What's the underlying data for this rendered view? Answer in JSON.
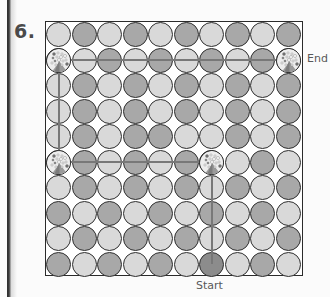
{
  "page": {
    "problem_number": "6.",
    "background_color": "#fbfbfb",
    "page_edge_color": "#2e2e2e"
  },
  "labels": {
    "start": "Start",
    "end": "End"
  },
  "colors": {
    "light_circle": "#d9d9d9",
    "dark_circle": "#a8a8a8",
    "start_circle": "#8c8c8c",
    "circle_outline": "#2f2f2f",
    "path_line": "#787878",
    "frame": "#2b2b2b",
    "text": "#585858"
  },
  "chart_data": {
    "type": "table",
    "rows": 10,
    "columns": 10,
    "cell_size": 25.5,
    "legend": [
      "light",
      "dark"
    ],
    "grid": [
      [
        "light",
        "dark",
        "light",
        "dark",
        "light",
        "dark",
        "light",
        "dark",
        "light",
        "dark"
      ],
      [
        "dark",
        "light",
        "dark",
        "light",
        "dark",
        "light",
        "dark",
        "light",
        "dark",
        "light"
      ],
      [
        "light",
        "dark",
        "light",
        "dark",
        "light",
        "dark",
        "light",
        "dark",
        "light",
        "dark"
      ],
      [
        "light",
        "dark",
        "light",
        "dark",
        "light",
        "dark",
        "light",
        "dark",
        "light",
        "dark"
      ],
      [
        "light",
        "dark",
        "light",
        "dark",
        "dark",
        "light",
        "light",
        "dark",
        "light",
        "dark"
      ],
      [
        "light",
        "dark",
        "light",
        "dark",
        "light",
        "dark",
        "dark",
        "light",
        "dark",
        "light"
      ],
      [
        "light",
        "dark",
        "light",
        "dark",
        "light",
        "dark",
        "light",
        "dark",
        "light",
        "dark"
      ],
      [
        "dark",
        "light",
        "dark",
        "light",
        "dark",
        "light",
        "dark",
        "light",
        "dark",
        "light"
      ],
      [
        "light",
        "dark",
        "light",
        "dark",
        "light",
        "dark",
        "light",
        "dark",
        "light",
        "dark"
      ],
      [
        "dark",
        "light",
        "dark",
        "light",
        "dark",
        "light",
        "start",
        "light",
        "dark",
        "light"
      ]
    ]
  },
  "markers": [
    {
      "name": "marker-top-left",
      "row": 2,
      "col": 1
    },
    {
      "name": "marker-top-right",
      "row": 2,
      "col": 10
    },
    {
      "name": "marker-mid-left",
      "row": 6,
      "col": 1
    },
    {
      "name": "marker-mid-center",
      "row": 6,
      "col": 7
    }
  ],
  "paths": [
    {
      "name": "path-top-horizontal",
      "orientation": "horizontal",
      "row": 2,
      "from_col": 1,
      "to_col": 10
    },
    {
      "name": "path-left-vertical",
      "orientation": "vertical",
      "col": 1,
      "from_row": 2,
      "to_row": 6
    },
    {
      "name": "path-mid-horizontal",
      "orientation": "horizontal",
      "row": 6,
      "from_col": 1,
      "to_col": 7
    },
    {
      "name": "path-center-vertical",
      "orientation": "vertical",
      "col": 7,
      "from_row": 6,
      "to_row": 10
    }
  ]
}
